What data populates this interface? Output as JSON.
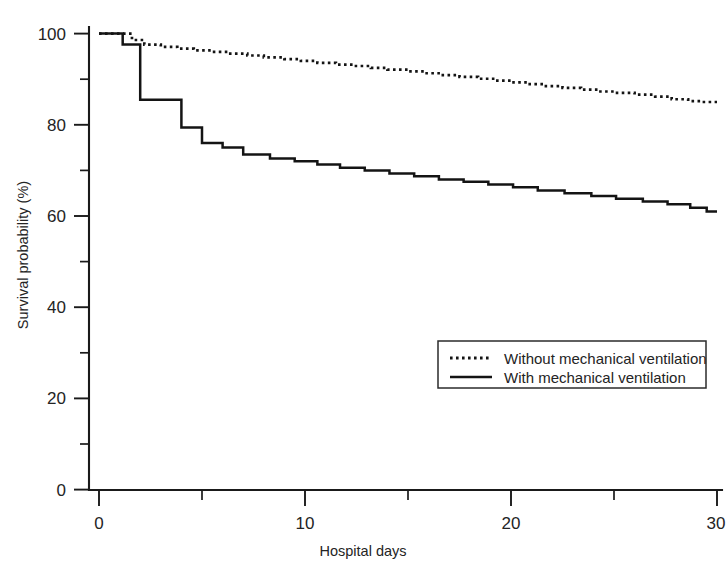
{
  "chart_data": {
    "type": "line",
    "subtype": "kaplan-meier-step",
    "title": "",
    "xlabel": "Hospital days",
    "ylabel": "Survival probability (%)",
    "xlim": [
      0,
      30
    ],
    "ylim": [
      0,
      100
    ],
    "x_major_ticks": [
      0,
      10,
      20,
      30
    ],
    "x_minor_ticks": [
      5,
      15,
      25
    ],
    "x_tick_labels": [
      "0",
      "10",
      "20",
      "30"
    ],
    "y_major_ticks": [
      0,
      20,
      40,
      60,
      80,
      100
    ],
    "y_minor_ticks": [
      10,
      30,
      50,
      70,
      90
    ],
    "y_tick_labels": [
      "0",
      "20",
      "40",
      "60",
      "80",
      "100"
    ],
    "grid": false,
    "legend_position": "center-right",
    "series": [
      {
        "name": "Without mechanical ventilation",
        "style": "dotted",
        "color": "#141414",
        "x": [
          0,
          1.0,
          1.6,
          2.2,
          3.0,
          3.8,
          4.6,
          5.5,
          6.3,
          7.2,
          8.0,
          9.0,
          9.8,
          10.6,
          11.5,
          12.4,
          13.2,
          14.0,
          15.0,
          15.8,
          16.6,
          17.5,
          18.4,
          19.2,
          20.0,
          20.8,
          21.6,
          22.5,
          23.4,
          24.2,
          25.0,
          26.0,
          27.0,
          27.8,
          28.6,
          29.3,
          30.0
        ],
        "y": [
          100.0,
          100.0,
          98.6,
          97.6,
          97.1,
          96.7,
          96.3,
          96.0,
          95.6,
          95.2,
          94.8,
          94.4,
          94.0,
          93.6,
          93.2,
          92.9,
          92.5,
          92.1,
          91.7,
          91.3,
          90.9,
          90.5,
          90.1,
          89.7,
          89.3,
          88.9,
          88.5,
          88.1,
          87.7,
          87.3,
          87.0,
          86.6,
          86.2,
          85.6,
          85.2,
          85.0,
          85.0
        ]
      },
      {
        "name": "With mechanical ventilation",
        "style": "solid",
        "color": "#141414",
        "x": [
          0,
          1.0,
          1.15,
          1.9,
          2.0,
          2.9,
          3.0,
          3.9,
          4.0,
          4.9,
          5.0,
          5.9,
          6.0,
          6.9,
          7.0,
          8.2,
          8.3,
          9.4,
          9.5,
          10.5,
          10.6,
          11.6,
          11.7,
          12.8,
          12.9,
          14.0,
          14.1,
          15.2,
          15.3,
          16.4,
          16.5,
          17.6,
          17.7,
          18.8,
          18.9,
          20.0,
          20.1,
          21.2,
          21.3,
          22.5,
          22.6,
          23.8,
          23.9,
          25.0,
          25.1,
          26.3,
          26.4,
          27.5,
          27.6,
          28.6,
          28.7,
          29.4,
          29.5,
          30.0
        ],
        "y": [
          100.0,
          100.0,
          97.6,
          97.6,
          85.5,
          85.5,
          85.5,
          85.5,
          79.4,
          79.4,
          76.0,
          76.0,
          75.0,
          75.0,
          73.5,
          73.5,
          72.6,
          72.6,
          72.0,
          72.0,
          71.3,
          71.3,
          70.6,
          70.6,
          70.0,
          70.0,
          69.3,
          69.3,
          68.7,
          68.7,
          68.0,
          68.0,
          67.5,
          67.5,
          66.9,
          66.9,
          66.3,
          66.3,
          65.6,
          65.6,
          65.0,
          65.0,
          64.4,
          64.4,
          63.8,
          63.8,
          63.2,
          63.2,
          62.6,
          62.6,
          61.8,
          61.8,
          61.0,
          61.0
        ]
      }
    ],
    "legend_entries": [
      {
        "label": "Without mechanical ventilation",
        "style": "dotted"
      },
      {
        "label": "With mechanical ventilation",
        "style": "solid"
      }
    ],
    "endpoint_values": {
      "without_ventilation_day30": 85.0,
      "with_ventilation_day30": 61.0
    }
  }
}
